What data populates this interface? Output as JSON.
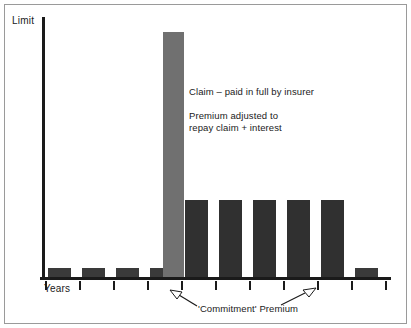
{
  "figure": {
    "border_color": "#9a9a9a",
    "background": "#ffffff"
  },
  "axes": {
    "y_label": "Limit",
    "x_label": "Years",
    "axis_color": "#1a1a1a",
    "tick_count": 11,
    "tick_positions": [
      45,
      79,
      113,
      147,
      181,
      215,
      249,
      283,
      317,
      351,
      385
    ]
  },
  "annotations": {
    "claim": "Claim – paid in full by insurer",
    "premium": "Premium adjusted to\nrepay claim + interest",
    "caption": "'Commitment' Premium"
  },
  "chart_data": {
    "type": "bar",
    "title": "",
    "xlabel": "Years",
    "ylabel": "Limit",
    "grid": false,
    "legend": "none",
    "ylim": [
      0,
      100
    ],
    "categories": [
      "1",
      "2",
      "3",
      "4",
      "5",
      "6",
      "7",
      "8",
      "9",
      "10",
      "11"
    ],
    "values": [
      4,
      4,
      4,
      4,
      96,
      31,
      31,
      31,
      31,
      31,
      4
    ],
    "bar_colors": [
      "#3a3a3a",
      "#3a3a3a",
      "#3a3a3a",
      "#3a3a3a",
      "#707070",
      "#303030",
      "#303030",
      "#303030",
      "#303030",
      "#303030",
      "#3a3a3a"
    ],
    "bars": [
      {
        "name": "bar-year-1",
        "left": 48,
        "width": 23,
        "height": 9,
        "color": "#3a3a3a"
      },
      {
        "name": "bar-year-2",
        "left": 82,
        "width": 23,
        "height": 9,
        "color": "#3a3a3a"
      },
      {
        "name": "bar-year-3",
        "left": 116,
        "width": 23,
        "height": 9,
        "color": "#3a3a3a"
      },
      {
        "name": "bar-year-4",
        "left": 150,
        "width": 23,
        "height": 9,
        "color": "#3a3a3a"
      },
      {
        "name": "bar-claim",
        "left": 163,
        "width": 21,
        "height": 245,
        "color": "#707070"
      },
      {
        "name": "bar-year-6",
        "left": 185,
        "width": 23,
        "height": 77,
        "color": "#303030"
      },
      {
        "name": "bar-year-7",
        "left": 219,
        "width": 23,
        "height": 77,
        "color": "#303030"
      },
      {
        "name": "bar-year-8",
        "left": 253,
        "width": 23,
        "height": 77,
        "color": "#303030"
      },
      {
        "name": "bar-year-9",
        "left": 287,
        "width": 23,
        "height": 77,
        "color": "#303030"
      },
      {
        "name": "bar-year-10",
        "left": 321,
        "width": 23,
        "height": 77,
        "color": "#303030"
      },
      {
        "name": "bar-year-11",
        "left": 355,
        "width": 23,
        "height": 9,
        "color": "#3a3a3a"
      }
    ]
  }
}
